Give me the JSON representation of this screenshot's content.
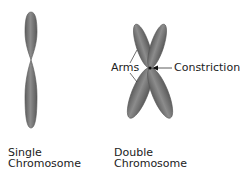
{
  "diagram": {
    "single": {
      "caption_line1": "Single",
      "caption_line2": "Chromosome"
    },
    "double": {
      "caption_line1": "Double",
      "caption_line2": "Chromosome"
    },
    "labels": {
      "arms": "Arms",
      "constriction": "Constriction"
    },
    "colors": {
      "chromosome_fill": "#7a7a7a",
      "chromosome_edge": "#555555",
      "text": "#222222"
    }
  }
}
